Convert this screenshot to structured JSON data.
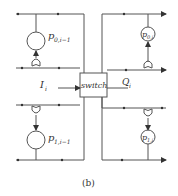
{
  "diagram": {
    "caption": "(b)",
    "switch_label": "switch",
    "input_label": "I",
    "input_sub": "i",
    "output_label": "Q",
    "output_sub": "i",
    "processors": [
      {
        "id": "p0_im1",
        "label": "p",
        "sub": "0,i−1"
      },
      {
        "id": "p0_i",
        "label": "p",
        "sub": "0,i"
      },
      {
        "id": "p1_im1",
        "label": "p",
        "sub": "1,i−1"
      },
      {
        "id": "p1_i",
        "label": "p",
        "sub": "1,i"
      }
    ]
  }
}
